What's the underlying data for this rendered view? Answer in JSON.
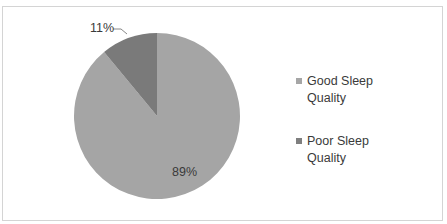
{
  "chart_data": {
    "type": "pie",
    "title": "",
    "categories": [
      "Good Sleep Quality",
      "Poor Sleep Quality"
    ],
    "values": [
      89,
      11
    ],
    "unit": "%",
    "data_labels": [
      "89%",
      "11%"
    ],
    "colors": [
      "#a5a5a5",
      "#7a7a7a"
    ],
    "start_angle_deg": 0,
    "direction": "clockwise-from-top: Good Sleep Quality first, Poor Sleep Quality last",
    "legend_position": "right"
  },
  "legend": {
    "items": [
      {
        "line1": "Good Sleep",
        "line2": "Quality",
        "color": "#a6a6a6"
      },
      {
        "line1": "Poor Sleep",
        "line2": "Quality",
        "color": "#7f7f7f"
      }
    ]
  },
  "labels": {
    "good": "89%",
    "poor": "11%"
  }
}
